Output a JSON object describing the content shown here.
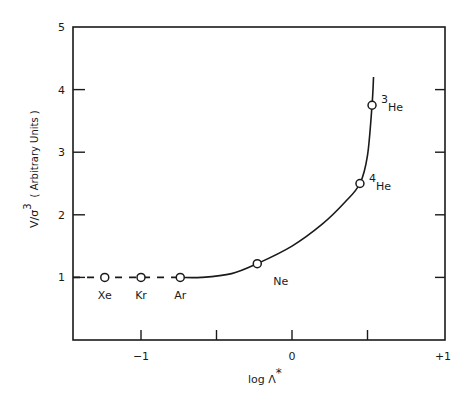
{
  "chart_data": {
    "type": "line",
    "title": "",
    "xlabel": "log Λ*",
    "ylabel": "V/σ³ (Arbitrary Units)",
    "ylabel_main": "V/σ",
    "ylabel_sup": "3",
    "ylabel_units": "( Arbitrary Units )",
    "xlabel_main": "log Λ",
    "xlabel_sup": "*",
    "xlim": [
      -1.45,
      1.0
    ],
    "ylim": [
      0,
      5
    ],
    "x_ticks": [
      -1,
      -0.5,
      0,
      0.5,
      1
    ],
    "x_tick_labels": [
      "−1",
      "",
      "0",
      "",
      "+1"
    ],
    "y_ticks": [
      1,
      2,
      3,
      4,
      5
    ],
    "y_tick_labels": [
      "1",
      "2",
      "3",
      "4",
      "5"
    ],
    "grid": false,
    "legend": null,
    "points": [
      {
        "label": "Xe",
        "x": -1.24,
        "y": 1.0
      },
      {
        "label": "Kr",
        "x": -1.0,
        "y": 1.0
      },
      {
        "label": "Ar",
        "x": -0.74,
        "y": 1.0
      },
      {
        "label": "Ne",
        "x": -0.23,
        "y": 1.22
      },
      {
        "label": "4He",
        "label_sup": "4",
        "label_main": "He",
        "x": 0.45,
        "y": 2.5
      },
      {
        "label": "3He",
        "label_sup": "3",
        "label_main": "He",
        "x": 0.53,
        "y": 3.75
      }
    ],
    "series": [
      {
        "name": "dashed extrapolation",
        "style": "dashed",
        "x": [
          -1.45,
          -0.74
        ],
        "y": [
          1.0,
          1.0
        ]
      },
      {
        "name": "theory curve",
        "style": "solid",
        "x": [
          -0.74,
          -0.6,
          -0.4,
          -0.23,
          0.0,
          0.2,
          0.35,
          0.45,
          0.5,
          0.53,
          0.54
        ],
        "y": [
          1.0,
          1.0,
          1.06,
          1.22,
          1.5,
          1.85,
          2.2,
          2.5,
          2.95,
          3.75,
          4.2
        ]
      }
    ]
  }
}
